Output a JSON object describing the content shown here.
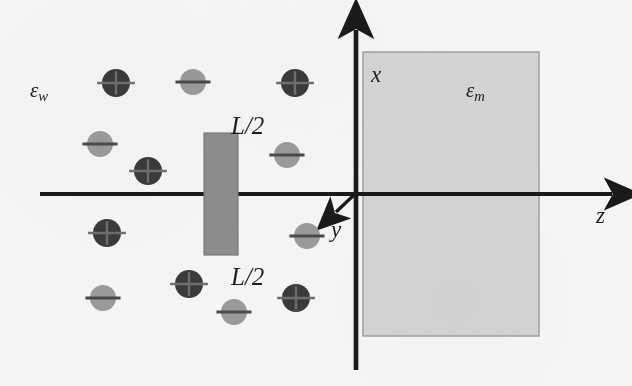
{
  "figure": {
    "background_color": "#f7f7f6"
  },
  "labels": {
    "epsilon_water": {
      "symbol": "ε",
      "subscript": "w",
      "x": 30,
      "y": 80
    },
    "epsilon_membrane": {
      "symbol": "ε",
      "subscript": "m",
      "x": 466,
      "y": 80
    },
    "length_top": {
      "text": "L/2",
      "x": 231,
      "y": 113
    },
    "length_bottom": {
      "text": "L/2",
      "x": 231,
      "y": 264
    },
    "axis_x": {
      "text": "x",
      "x": 371,
      "y": 63
    },
    "axis_y": {
      "text": "y",
      "x": 331,
      "y": 218
    },
    "axis_z": {
      "text": "z",
      "x": 596,
      "y": 204
    }
  },
  "axes": {
    "origin": {
      "x": 356,
      "y": 194
    },
    "z_axis": {
      "x1": 40,
      "y1": 194,
      "x2": 622,
      "y2": 194,
      "arrow": "right",
      "label": "z"
    },
    "x_axis": {
      "x1": 356,
      "y1": 370,
      "x2": 356,
      "y2": 22,
      "arrow": "up",
      "label": "x"
    },
    "y_axis": {
      "x1": 356,
      "y1": 194,
      "x2": 332,
      "y2": 216,
      "arrow": "down-left",
      "label": "y"
    },
    "line_color": "#1a1a1a",
    "line_width": 4
  },
  "membrane_region": {
    "name": "epsilon_m_slab",
    "x": 363,
    "y": 52,
    "width": 176,
    "height": 284,
    "fill": "#d6d6d6",
    "stroke": "#9a9a9a"
  },
  "charged_bar": {
    "name": "L-half-slab",
    "x": 204,
    "y": 133,
    "width": 34,
    "height": 122,
    "fill": "#8e8e8e",
    "stroke": "#7c7c7c"
  },
  "charge_colors": {
    "positive_fill": "#3b3b3b",
    "positive_mark": "#6f6f6f",
    "negative_fill": "#9b9b9b",
    "negative_mark": "#4a4a4a"
  },
  "charges": [
    {
      "id": "c1",
      "sign": "+",
      "cx": 116,
      "cy": 83,
      "r": 14
    },
    {
      "id": "c2",
      "sign": "-",
      "cx": 193,
      "cy": 82,
      "r": 13
    },
    {
      "id": "c3",
      "sign": "+",
      "cx": 295,
      "cy": 83,
      "r": 14
    },
    {
      "id": "c4",
      "sign": "-",
      "cx": 100,
      "cy": 144,
      "r": 13
    },
    {
      "id": "c5",
      "sign": "+",
      "cx": 148,
      "cy": 171,
      "r": 14
    },
    {
      "id": "c6",
      "sign": "-",
      "cx": 287,
      "cy": 155,
      "r": 13
    },
    {
      "id": "c7",
      "sign": "+",
      "cx": 107,
      "cy": 233,
      "r": 14
    },
    {
      "id": "c8",
      "sign": "-",
      "cx": 307,
      "cy": 236,
      "r": 13
    },
    {
      "id": "c9",
      "sign": "-",
      "cx": 103,
      "cy": 298,
      "r": 13
    },
    {
      "id": "c10",
      "sign": "+",
      "cx": 189,
      "cy": 284,
      "r": 14
    },
    {
      "id": "c11",
      "sign": "-",
      "cx": 234,
      "cy": 312,
      "r": 13
    },
    {
      "id": "c12",
      "sign": "+",
      "cx": 296,
      "cy": 298,
      "r": 14
    }
  ]
}
